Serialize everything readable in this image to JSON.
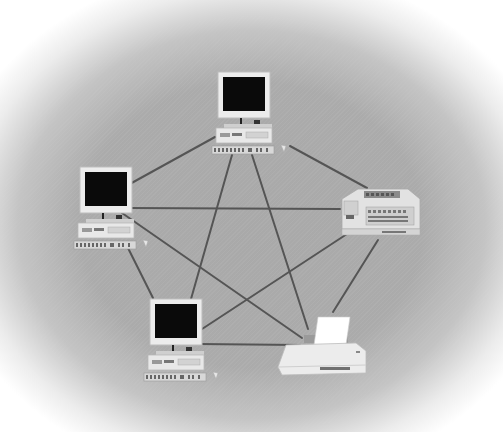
{
  "diagram": {
    "type": "mesh-network-topology",
    "node_count": 5,
    "link_count": 10,
    "colors": {
      "background_center": "#ababab",
      "background_edge": "#ffffff",
      "link": "#555555",
      "monitor_screen": "#0a0a0a",
      "device_body": "#e6e6e6"
    },
    "nodes": [
      {
        "id": "pc-top",
        "kind": "desktop-computer",
        "icon": "computer-icon",
        "label": "Computer 1",
        "x": 243,
        "y": 108
      },
      {
        "id": "pc-left",
        "kind": "desktop-computer",
        "icon": "computer-icon",
        "label": "Computer 2",
        "x": 105,
        "y": 205
      },
      {
        "id": "fax",
        "kind": "fax-machine",
        "icon": "fax-icon",
        "label": "Fax machine",
        "x": 380,
        "y": 210
      },
      {
        "id": "pc-bottom",
        "kind": "desktop-computer",
        "icon": "computer-icon",
        "label": "Computer 3",
        "x": 175,
        "y": 337
      },
      {
        "id": "printer",
        "kind": "printer",
        "icon": "printer-icon",
        "label": "Printer",
        "x": 322,
        "y": 355
      }
    ],
    "links": [
      {
        "from": "pc-top",
        "to": "pc-left",
        "x1": 215,
        "y1": 137,
        "x2": 128,
        "y2": 185
      },
      {
        "from": "pc-top",
        "to": "fax",
        "x1": 290,
        "y1": 146,
        "x2": 367,
        "y2": 188
      },
      {
        "from": "pc-top",
        "to": "pc-bottom",
        "x1": 232,
        "y1": 155,
        "x2": 191,
        "y2": 299
      },
      {
        "from": "pc-top",
        "to": "printer",
        "x1": 252,
        "y1": 155,
        "x2": 308,
        "y2": 329
      },
      {
        "from": "pc-left",
        "to": "fax",
        "x1": 128,
        "y1": 208,
        "x2": 340,
        "y2": 209
      },
      {
        "from": "pc-left",
        "to": "pc-bottom",
        "x1": 128,
        "y1": 248,
        "x2": 153,
        "y2": 298
      },
      {
        "from": "pc-left",
        "to": "printer",
        "x1": 122,
        "y1": 213,
        "x2": 302,
        "y2": 338
      },
      {
        "from": "fax",
        "to": "pc-bottom",
        "x1": 350,
        "y1": 232,
        "x2": 199,
        "y2": 331
      },
      {
        "from": "fax",
        "to": "printer",
        "x1": 378,
        "y1": 240,
        "x2": 333,
        "y2": 312
      },
      {
        "from": "pc-bottom",
        "to": "printer",
        "x1": 198,
        "y1": 344,
        "x2": 300,
        "y2": 345
      }
    ]
  }
}
